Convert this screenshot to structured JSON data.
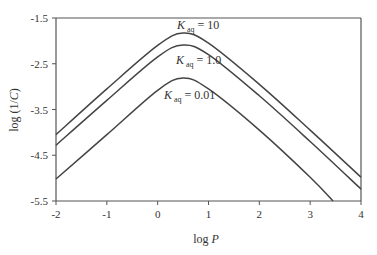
{
  "chart_data": {
    "type": "line",
    "title": "",
    "xlabel": "log P",
    "ylabel": "log (1/C)",
    "xlim": [
      -2,
      4
    ],
    "ylim": [
      -5.5,
      -1.5
    ],
    "x_ticks": [
      -2,
      -1,
      0,
      1,
      2,
      3,
      4
    ],
    "x_tick_labels": [
      "-2",
      "-1",
      "0",
      "1",
      "2",
      "3",
      "4"
    ],
    "y_ticks": [
      -1.5,
      -2.5,
      -3.5,
      -4.5,
      -5.5
    ],
    "y_tick_labels": [
      "-1.5",
      "-2.5",
      "-3.5",
      "-4.5",
      "-5.5"
    ],
    "grid": false,
    "legend": "inline labels",
    "series": [
      {
        "name": "K_aq = 10",
        "label_main": "K",
        "label_sub": "aq",
        "label_rest": " = 10",
        "peak_x": 0.5,
        "peak_y": -1.83,
        "start_y": -4.05,
        "end_y": -4.98,
        "x": [
          -2,
          -1,
          0,
          0.5,
          1,
          2,
          3,
          4
        ],
        "values": [
          -4.05,
          -3.05,
          -2.1,
          -1.83,
          -2.05,
          -2.95,
          -3.95,
          -4.98
        ]
      },
      {
        "name": "K_aq = 1.0",
        "label_main": "K",
        "label_sub": "aq",
        "label_rest": " = 1.0",
        "peak_x": 0.5,
        "peak_y": -2.09,
        "start_y": -4.28,
        "end_y": -5.24,
        "x": [
          -2,
          -1,
          0,
          0.5,
          1,
          2,
          3,
          4
        ],
        "values": [
          -4.28,
          -3.3,
          -2.35,
          -2.09,
          -2.3,
          -3.2,
          -4.2,
          -5.24
        ]
      },
      {
        "name": "K_aq = 0.01",
        "label_main": "K",
        "label_sub": "aq",
        "label_rest": " = 0.01",
        "peak_x": 0.5,
        "peak_y": -2.81,
        "start_y": -5.02,
        "end_y": -5.5,
        "x": [
          -2,
          -1,
          0,
          0.5,
          1,
          2,
          3,
          3.45
        ],
        "values": [
          -5.02,
          -4.05,
          -3.08,
          -2.81,
          -3.05,
          -3.95,
          -4.98,
          -5.5
        ]
      }
    ]
  },
  "colors": {
    "line": "#444444",
    "axis": "#555555",
    "text": "#333333"
  }
}
